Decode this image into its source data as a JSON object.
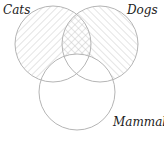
{
  "diagram": {
    "type": "venn",
    "sets": [
      {
        "name": "Cats",
        "label": "Cats",
        "cx": 53,
        "cy": 44,
        "r": 38,
        "hatch": "backslash"
      },
      {
        "name": "Dogs",
        "label": "Dogs",
        "cx": 100,
        "cy": 44,
        "r": 38,
        "hatch": "slash"
      },
      {
        "name": "Mammals",
        "label": "Mammals",
        "cx": 77,
        "cy": 92,
        "r": 38,
        "hatch": "none"
      }
    ],
    "shading": {
      "cats_only_outside_mammals": "backslash-hatch",
      "dogs_only_outside_mammals": "slash-hatch",
      "cats_and_dogs_outside_mammals": "cross-hatch",
      "inside_mammals": "unshaded"
    },
    "colors": {
      "outline": "#b5b5b5",
      "hatch": "#c4c4c4",
      "label": "#222222",
      "background": "#ffffff"
    }
  }
}
